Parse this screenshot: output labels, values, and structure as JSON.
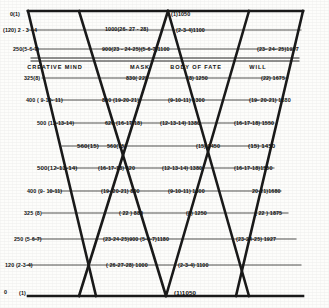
{
  "figure": {
    "type": "diagram",
    "faculty_labels": [
      {
        "text": "CREATIVE MIND",
        "x": 55,
        "y": 67
      },
      {
        "text": "MASK",
        "x": 140,
        "y": 67
      },
      {
        "text": "BODY OF FATE",
        "x": 196,
        "y": 67
      },
      {
        "text": "WILL",
        "x": 258,
        "y": 67
      }
    ],
    "rows": [
      {
        "y": 14,
        "labels": [
          {
            "text": "0(1)",
            "x": 20,
            "y": 14,
            "align": "right"
          },
          {
            "text": "(1)1050",
            "x": 171,
            "y": 14,
            "align": "left"
          }
        ]
      },
      {
        "y": 30,
        "labels": [
          {
            "text": "(120) 2 - 3 - 4",
            "x": 3,
            "y": 30,
            "align": "left"
          },
          {
            "text": "1000(26- 27 - 28)",
            "x": 105,
            "y": 29,
            "align": "left"
          },
          {
            "text": "(2-3-4)1100",
            "x": 176,
            "y": 30,
            "align": "left"
          }
        ]
      },
      {
        "y": 49,
        "labels": [
          {
            "text": "250(5-6-7)",
            "x": 13,
            "y": 49,
            "align": "left"
          },
          {
            "text": "900(23 - 24-25)(5-6-7)1100",
            "x": 102,
            "y": 49,
            "align": "left"
          },
          {
            "text": "(23- 24- 25)1927",
            "x": 257,
            "y": 49,
            "align": "left"
          }
        ]
      },
      {
        "y": 78,
        "labels": [
          {
            "text": "325(8)",
            "x": 24,
            "y": 78,
            "align": "left"
          },
          {
            "text": "830( 22)",
            "x": 126,
            "y": 78,
            "align": "left"
          },
          {
            "text": "(8) 1250",
            "x": 187,
            "y": 78,
            "align": "left"
          },
          {
            "text": "(22) 1675",
            "x": 261,
            "y": 78,
            "align": "left"
          }
        ]
      },
      {
        "y": 100,
        "labels": [
          {
            "text": "400 ( 9-10- 11)",
            "x": 26,
            "y": 100,
            "align": "left"
          },
          {
            "text": "800 (19-20-21)",
            "x": 102,
            "y": 100,
            "align": "left"
          },
          {
            "text": "(9-10-11) 1300",
            "x": 168,
            "y": 100,
            "align": "left"
          },
          {
            "text": "(19- 20-21) 1680",
            "x": 249,
            "y": 100,
            "align": "left"
          }
        ]
      },
      {
        "y": 123,
        "labels": [
          {
            "text": "500 (12-13-14)",
            "x": 37,
            "y": 123,
            "align": "left"
          },
          {
            "text": "620 (16-17-18)",
            "x": 105,
            "y": 123,
            "align": "left"
          },
          {
            "text": "(12-13-14) 1380",
            "x": 160,
            "y": 123,
            "align": "left"
          },
          {
            "text": "(16-17-18) 1550",
            "x": 234,
            "y": 123,
            "align": "left"
          }
        ]
      },
      {
        "y": 146,
        "labels": [
          {
            "text": "560(15)",
            "x": 77,
            "y": 146,
            "align": "left"
          },
          {
            "text": "560(15)",
            "x": 104,
            "y": 146,
            "align": "left"
          },
          {
            "text": "(15) 1450",
            "x": 196,
            "y": 146,
            "align": "left"
          },
          {
            "text": "(15) 1450",
            "x": 248,
            "y": 146,
            "align": "left"
          }
        ]
      },
      {
        "y": 168,
        "labels": [
          {
            "text": "500(12-13-14)",
            "x": 37,
            "y": 168,
            "align": "left"
          },
          {
            "text": "(16-17-18) 620",
            "x": 98,
            "y": 168,
            "align": "left"
          },
          {
            "text": "(12-13-14) 1380",
            "x": 162,
            "y": 168,
            "align": "left"
          },
          {
            "text": "(16-17-18)1550",
            "x": 234,
            "y": 168,
            "align": "left"
          }
        ]
      },
      {
        "y": 191,
        "labels": [
          {
            "text": "400 (9- 10-11)",
            "x": 27,
            "y": 191,
            "align": "left"
          },
          {
            "text": "(19- 20-21) 800",
            "x": 101,
            "y": 191,
            "align": "left"
          },
          {
            "text": "(9-10-11) 1300",
            "x": 168,
            "y": 191,
            "align": "left"
          },
          {
            "text": "20-21)1680",
            "x": 252,
            "y": 191,
            "align": "left"
          }
        ]
      },
      {
        "y": 213,
        "labels": [
          {
            "text": "325 (8)",
            "x": 24,
            "y": 213,
            "align": "left"
          },
          {
            "text": "( 22 )  880",
            "x": 119,
            "y": 213,
            "align": "left"
          },
          {
            "text": "(8)  1250",
            "x": 186,
            "y": 213,
            "align": "left"
          },
          {
            "text": "( 22 ) 1875",
            "x": 255,
            "y": 213,
            "align": "left"
          }
        ]
      },
      {
        "y": 239,
        "labels": [
          {
            "text": "250 (5-6-7)",
            "x": 14,
            "y": 239,
            "align": "left"
          },
          {
            "text": "(23-24-25)900 (5-6-7)1180",
            "x": 103,
            "y": 239,
            "align": "left"
          },
          {
            "text": "(23-24-25) 1927",
            "x": 236,
            "y": 239,
            "align": "left"
          }
        ]
      },
      {
        "y": 265,
        "labels": [
          {
            "text": "120 (2-3-4)",
            "x": 5,
            "y": 265,
            "align": "left"
          },
          {
            "text": "( 26-27-28) 1000",
            "x": 106,
            "y": 265,
            "align": "left"
          },
          {
            "text": "(2-3-4) 1100",
            "x": 178,
            "y": 265,
            "align": "left"
          }
        ]
      },
      {
        "y": 292,
        "labels": [
          {
            "text": "0",
            "x": 4,
            "y": 292,
            "align": "left"
          },
          {
            "text": "(1)",
            "x": 19,
            "y": 293,
            "align": "left"
          },
          {
            "text": "(1)1050",
            "x": 174,
            "y": 293,
            "align": "left"
          }
        ]
      }
    ],
    "geometry": {
      "outer_top_y": 11,
      "outer_bottom_y": 296,
      "left_apex_x": 28,
      "right_apex_x": 303,
      "inner_x": 79,
      "inner_right_x": 249,
      "stroke_color": "#151515"
    }
  }
}
